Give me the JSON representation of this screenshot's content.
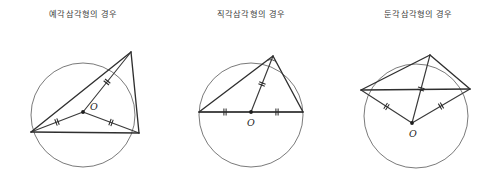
{
  "figure": {
    "background_color": "#ffffff",
    "width": 502,
    "height": 192
  },
  "panels": [
    {
      "id": "acute",
      "title": "예각삼각형의 경우",
      "center_label": "O",
      "circle": {
        "cx": 83,
        "cy": 115,
        "r": 52
      },
      "center_point": {
        "x": 83,
        "y": 112
      },
      "center_label_pos": {
        "x": 90,
        "y": 110
      },
      "vertices": [
        {
          "name": "A",
          "x": 131,
          "y": 52
        },
        {
          "name": "B",
          "x": 31,
          "y": 132
        },
        {
          "name": "C",
          "x": 139,
          "y": 133
        }
      ],
      "radii_ticks": 2,
      "has_right_angle_marker": false
    },
    {
      "id": "right",
      "title": "직각삼각형의 경우",
      "center_label": "O",
      "circle": {
        "cx": 251,
        "cy": 115,
        "r": 52
      },
      "center_point": {
        "x": 251,
        "y": 112
      },
      "center_label_pos": {
        "x": 247,
        "y": 126
      },
      "vertices": [
        {
          "name": "A",
          "x": 273,
          "y": 56
        },
        {
          "name": "B",
          "x": 199,
          "y": 112
        },
        {
          "name": "C",
          "x": 303,
          "y": 112
        }
      ],
      "radii_ticks": 2,
      "has_right_angle_marker": true
    },
    {
      "id": "obtuse",
      "title": "둔각삼각형의 경우",
      "center_label": "O",
      "circle": {
        "cx": 416,
        "cy": 116,
        "r": 52
      },
      "center_point": {
        "x": 412,
        "y": 123
      },
      "center_label_pos": {
        "x": 409,
        "y": 137
      },
      "vertices": [
        {
          "name": "A",
          "x": 430,
          "y": 55
        },
        {
          "name": "B",
          "x": 361,
          "y": 90
        },
        {
          "name": "C",
          "x": 470,
          "y": 89
        }
      ],
      "radii_ticks": 2,
      "has_right_angle_marker": false
    }
  ],
  "colors": {
    "circle_stroke": "#6b6b6b",
    "triangle_stroke": "#2f2f2f",
    "radius_stroke": "#3a3a3a",
    "tick_stroke": "#2a2a2a",
    "title_text": "#3a3a3a",
    "center_dot": "#1d1d1d"
  }
}
